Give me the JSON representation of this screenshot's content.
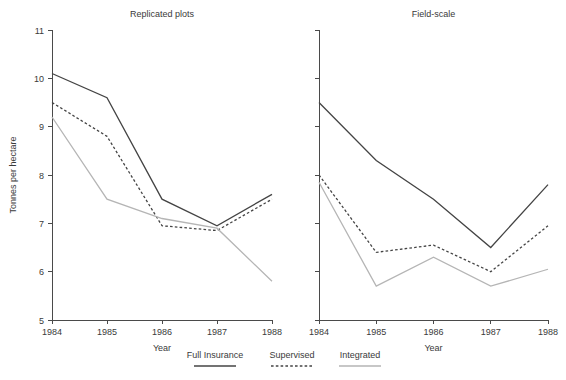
{
  "figure": {
    "width": 566,
    "height": 380,
    "background": "#ffffff"
  },
  "axis": {
    "xlabel": "Year",
    "ylabel": "Tonnes per hectare",
    "x_ticks": [
      "1984",
      "1985",
      "1986",
      "1987",
      "1988"
    ],
    "y_ticks": [
      "5",
      "6",
      "7",
      "8",
      "9",
      "10",
      "11"
    ]
  },
  "legend": {
    "items": [
      {
        "label": "Full Insurance",
        "style": "solid",
        "color": "#444444",
        "width": 1.3
      },
      {
        "label": "Supervised",
        "style": "dashed",
        "color": "#444444",
        "width": 1.3
      },
      {
        "label": "Integrated",
        "style": "solid",
        "color": "#b5b5b5",
        "width": 1.3
      }
    ]
  },
  "chart_data": [
    {
      "type": "line",
      "title": "Replicated plots",
      "xlabel": "Year",
      "ylabel": "Tonnes per hectare",
      "x": [
        1984,
        1985,
        1986,
        1987,
        1988
      ],
      "categories": [
        "1984",
        "1985",
        "1986",
        "1987",
        "1988"
      ],
      "xlim": [
        1984,
        1988
      ],
      "ylim": [
        5,
        11
      ],
      "grid": false,
      "legend_position": "bottom-center",
      "series": [
        {
          "name": "Full Insurance",
          "values": [
            10.1,
            9.6,
            7.5,
            6.95,
            7.6
          ]
        },
        {
          "name": "Supervised",
          "values": [
            9.5,
            8.8,
            6.95,
            6.85,
            7.5
          ]
        },
        {
          "name": "Integrated",
          "values": [
            9.2,
            7.5,
            7.1,
            6.9,
            5.8
          ]
        }
      ]
    },
    {
      "type": "line",
      "title": "Field-scale",
      "xlabel": "Year",
      "ylabel": "",
      "x": [
        1984,
        1985,
        1986,
        1987,
        1988
      ],
      "categories": [
        "1984",
        "1985",
        "1986",
        "1987",
        "1988"
      ],
      "xlim": [
        1984,
        1988
      ],
      "ylim": [
        5,
        11
      ],
      "grid": false,
      "legend_position": "bottom-center",
      "series": [
        {
          "name": "Full Insurance",
          "values": [
            9.5,
            8.3,
            7.5,
            6.5,
            7.8
          ]
        },
        {
          "name": "Supervised",
          "values": [
            8.0,
            6.4,
            6.55,
            6.0,
            6.95
          ]
        },
        {
          "name": "Integrated",
          "values": [
            7.85,
            5.7,
            6.3,
            5.7,
            6.05
          ]
        }
      ]
    }
  ]
}
